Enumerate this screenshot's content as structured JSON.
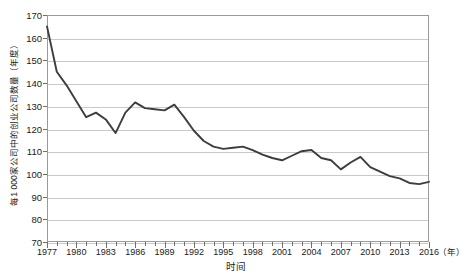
{
  "chart_data": {
    "type": "line",
    "title": "",
    "subtitle": "",
    "xlabel": "时间",
    "ylabel": "每1 000家公司中的创业公司数量（年度）",
    "x_unit_label": "（年）",
    "xlim": [
      1977,
      2016
    ],
    "ylim": [
      70,
      170
    ],
    "y_ticks": [
      70,
      80,
      90,
      100,
      110,
      120,
      130,
      140,
      150,
      160,
      170
    ],
    "x_ticks_major": [
      1977,
      1980,
      1983,
      1986,
      1989,
      1992,
      1995,
      1998,
      2001,
      2004,
      2007,
      2010,
      2013,
      2016
    ],
    "x_ticks_minor_step": 1,
    "grid": "horizontal",
    "legend": "none",
    "series_color": "#3d3d3d",
    "frame_color": "#9a9a9a",
    "grid_color": "#c9c9c9",
    "background_color": "#ffffff",
    "x": [
      1977,
      1978,
      1979,
      1980,
      1981,
      1982,
      1983,
      1984,
      1985,
      1986,
      1987,
      1988,
      1989,
      1990,
      1991,
      1992,
      1993,
      1994,
      1995,
      1996,
      1997,
      1998,
      1999,
      2000,
      2001,
      2002,
      2003,
      2004,
      2005,
      2006,
      2007,
      2008,
      2009,
      2010,
      2011,
      2012,
      2013,
      2014,
      2015,
      2016
    ],
    "values": [
      165,
      145,
      139,
      132,
      125,
      127,
      124,
      118,
      127,
      131.5,
      129,
      128.5,
      128,
      130.5,
      125,
      119,
      114.5,
      112,
      111,
      111.5,
      112,
      110.5,
      108.5,
      107,
      106,
      108,
      110,
      110.5,
      107,
      106,
      102,
      105,
      107.5,
      103,
      101,
      99,
      98,
      96,
      95.5,
      96.5
    ]
  }
}
